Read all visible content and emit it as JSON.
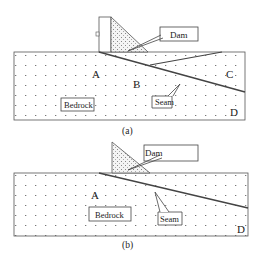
{
  "panels": [
    {
      "id": "a",
      "caption": "(a)",
      "labels": {
        "dam": "Dam",
        "bedrock": "Bedrock",
        "seam": "Seam",
        "A": "A",
        "B": "B",
        "C": "C",
        "D": "D"
      }
    },
    {
      "id": "b",
      "caption": "(b)",
      "labels": {
        "dam": "Dam",
        "bedrock": "Bedrock",
        "seam": "Seam",
        "A": "A",
        "D": "D"
      }
    }
  ],
  "colors": {
    "line": "#444444",
    "fill": "#ffffff",
    "dot": "#777777"
  }
}
